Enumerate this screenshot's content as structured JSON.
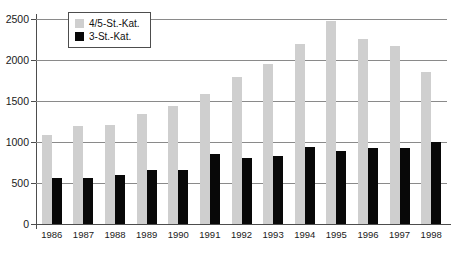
{
  "chart_data": {
    "type": "bar",
    "title": "",
    "subtitle": "",
    "xlabel": "",
    "ylabel": "",
    "categories": [
      "1986",
      "1987",
      "1988",
      "1989",
      "1990",
      "1991",
      "1992",
      "1993",
      "1994",
      "1995",
      "1996",
      "1997",
      "1998"
    ],
    "series": [
      {
        "name": "4/5-St.-Kat.",
        "color": "#cfcfcf",
        "values": [
          1080,
          1190,
          1210,
          1340,
          1440,
          1580,
          1790,
          1950,
          2190,
          2470,
          2260,
          2170,
          1850
        ]
      },
      {
        "name": "3-St.-Kat.",
        "color": "#080808",
        "values": [
          560,
          560,
          600,
          660,
          660,
          850,
          810,
          830,
          940,
          890,
          930,
          930,
          1000
        ]
      }
    ],
    "ylim": [
      0,
      2500
    ],
    "yticks": [
      0,
      500,
      1000,
      1500,
      2000,
      2500
    ],
    "ytick_labels": [
      "0",
      "500",
      "1000",
      "1500",
      "2000",
      "2500"
    ],
    "grid": true,
    "grid_axis": "y",
    "legend_position": "top-left-inside",
    "axis_color": "#4d4d4d",
    "grid_color": "#8a8a8a",
    "background": "#ffffff"
  },
  "legend": {
    "items": [
      {
        "label": "4/5-St.-Kat.",
        "swatch": "light"
      },
      {
        "label": "3-St.-Kat.",
        "swatch": "dark"
      }
    ]
  }
}
